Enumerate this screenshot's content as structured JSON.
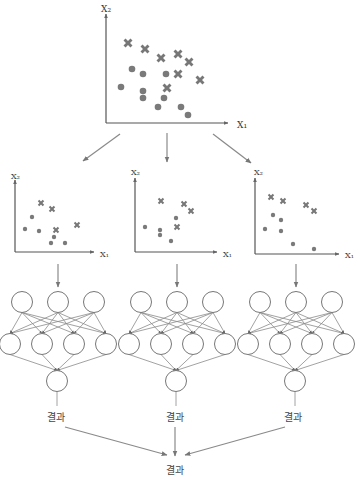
{
  "diagram": {
    "type": "ensemble-neural-network",
    "colors": {
      "axis": "#555555",
      "arrow": "#8a8a8a",
      "marker": "#777777",
      "background": "#ffffff"
    },
    "top_plot": {
      "x_label": "X₁",
      "y_label": "X₂",
      "crosses": [
        [
          128,
          43
        ],
        [
          145,
          49
        ],
        [
          161,
          58
        ],
        [
          178,
          54
        ],
        [
          189,
          62
        ],
        [
          178,
          74
        ],
        [
          200,
          80
        ],
        [
          167,
          88
        ]
      ],
      "dots": [
        [
          132,
          69
        ],
        [
          143,
          74
        ],
        [
          166,
          74
        ],
        [
          121,
          87
        ],
        [
          143,
          91
        ],
        [
          143,
          98
        ],
        [
          164,
          98
        ],
        [
          158,
          107
        ],
        [
          181,
          107
        ],
        [
          188,
          115
        ]
      ]
    },
    "sub_plots": [
      {
        "x_label": "X₁",
        "y_label": "X₂",
        "crosses": [
          [
            41,
            203
          ],
          [
            52,
            209
          ],
          [
            56,
            230
          ],
          [
            77,
            225
          ]
        ],
        "dots": [
          [
            32,
            217
          ],
          [
            25,
            229
          ],
          [
            39,
            231
          ],
          [
            54,
            237
          ],
          [
            51,
            243
          ],
          [
            65,
            243
          ]
        ]
      },
      {
        "x_label": "X₁",
        "y_label": "X₂",
        "crosses": [
          [
            161,
            201
          ],
          [
            184,
            204
          ],
          [
            191,
            211
          ],
          [
            177,
            227
          ]
        ],
        "dots": [
          [
            176,
            218
          ],
          [
            145,
            227
          ],
          [
            160,
            230
          ],
          [
            160,
            235
          ],
          [
            171,
            241
          ]
        ]
      },
      {
        "x_label": "X₁",
        "y_label": "X₂",
        "crosses": [
          [
            271,
            197
          ],
          [
            283,
            201
          ],
          [
            306,
            205
          ],
          [
            314,
            211
          ]
        ],
        "dots": [
          [
            273,
            215
          ],
          [
            281,
            220
          ],
          [
            265,
            229
          ],
          [
            281,
            231
          ],
          [
            293,
            244
          ],
          [
            314,
            249
          ]
        ]
      }
    ],
    "networks": [
      {
        "center_x": 58
      },
      {
        "center_x": 177
      },
      {
        "center_x": 296
      }
    ],
    "network_layers": [
      3,
      4,
      1
    ],
    "branch_results": [
      "결과",
      "결과",
      "결과"
    ],
    "final_result": "결과"
  }
}
